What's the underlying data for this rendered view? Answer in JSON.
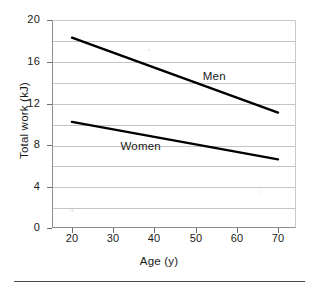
{
  "chart_data": {
    "type": "line",
    "title": "",
    "xlabel": "Age (y)",
    "ylabel": "Total work (kJ)",
    "xlim": [
      20,
      70
    ],
    "ylim": [
      0,
      20
    ],
    "xticks": [
      20,
      30,
      40,
      50,
      60,
      70
    ],
    "yticks": [
      0,
      4,
      8,
      12,
      16,
      20
    ],
    "xtick_labels": [
      "20",
      "30",
      "40",
      "50",
      "60",
      "70"
    ],
    "ytick_labels": [
      "0",
      "4",
      "8",
      "12",
      "16",
      "20"
    ],
    "gridlines": {
      "horizontal": [
        2,
        4,
        6,
        8,
        10,
        12,
        14,
        16,
        18
      ],
      "vertical": [],
      "visible": true
    },
    "legend": {
      "position": "inline-annotations",
      "entries": [
        "Men",
        "Women"
      ]
    },
    "series": [
      {
        "name": "Men",
        "color": "#000000",
        "x": [
          20,
          70
        ],
        "values": [
          18.3,
          11.1
        ],
        "annotation": {
          "text": "Men",
          "x": 52,
          "y": 14.6
        }
      },
      {
        "name": "Women",
        "color": "#000000",
        "x": [
          20,
          70
        ],
        "values": [
          10.2,
          6.6
        ],
        "annotation": {
          "text": "Women",
          "x": 32,
          "y": 7.9
        }
      }
    ]
  },
  "axes": {
    "x_title": "Age (y)",
    "y_title": "Total work (kJ)"
  },
  "colors": {
    "line": "#000000",
    "grid": "#c4c4c4",
    "axis": "#8d8d8d",
    "text": "#1a1a1a",
    "rule": "#4a4a4a",
    "background": "#ffffff"
  }
}
